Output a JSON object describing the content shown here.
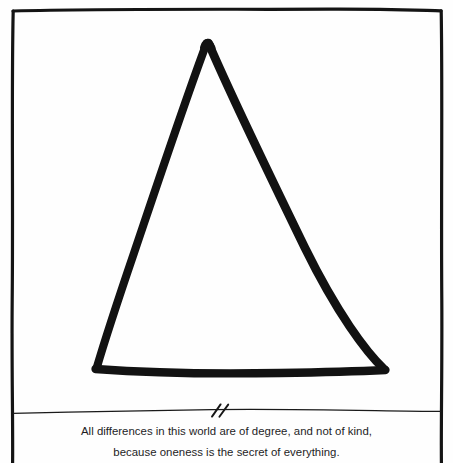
{
  "figure": {
    "kind": "hand-drawn-geometric-illustration",
    "shape_name": "triangle",
    "border_color": "#141414",
    "ink_color": "#121212",
    "page_color": "#fefefe",
    "divider_color": "#1a1a1a",
    "tick_mark_name": "double-slash-break-mark",
    "tick_mark_count": 2,
    "frame": {
      "left": 12,
      "top": 10,
      "right": 442,
      "bottom": 463
    },
    "divider_y": 412,
    "triangle_vertices": {
      "apex": [
        207,
        42
      ],
      "bottom_left": [
        95,
        369
      ],
      "bottom_right": [
        385,
        370
      ]
    },
    "stroke_width": 8
  },
  "caption": {
    "line1": "All differences in this world are of degree, and not of kind,",
    "line2": "because oneness is the secret of everything.",
    "color": "#1d1d1f"
  }
}
